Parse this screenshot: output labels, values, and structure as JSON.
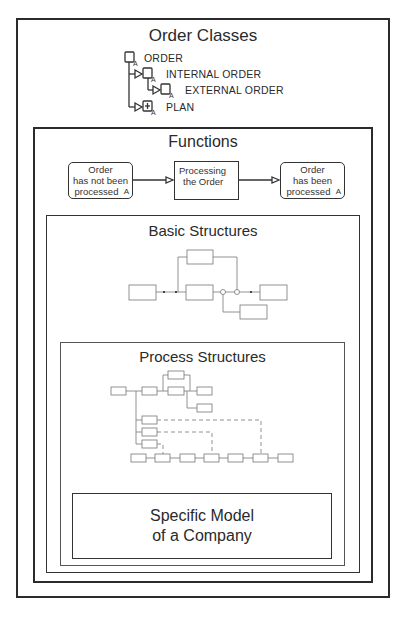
{
  "order_classes": {
    "title": "Order Classes",
    "items": [
      {
        "label": "ORDER",
        "icon": "class-icon"
      },
      {
        "label": "INTERNAL ORDER",
        "icon": "class-icon"
      },
      {
        "label": "EXTERNAL ORDER",
        "icon": "class-icon"
      },
      {
        "label": "PLAN",
        "icon": "class-plus-icon"
      }
    ]
  },
  "functions": {
    "title": "Functions",
    "boxes": [
      {
        "line1": "Order",
        "line2": "has not been",
        "line3": "processed",
        "tag": "A"
      },
      {
        "line1": "Processing",
        "line2": "the Order"
      },
      {
        "line1": "Order",
        "line2": "has been",
        "line3": "processed",
        "tag": "A"
      }
    ]
  },
  "basic_structures": {
    "title": "Basic Structures"
  },
  "process_structures": {
    "title": "Process Structures"
  },
  "specific_model": {
    "line1": "Specific Model",
    "line2": "of a Company"
  },
  "colors": {
    "line": "#333333",
    "light_line": "#888888",
    "background": "#ffffff"
  }
}
